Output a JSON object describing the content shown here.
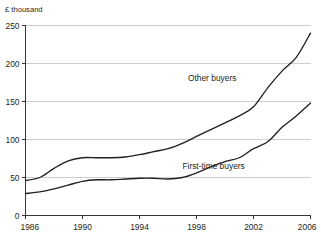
{
  "chart_data": {
    "type": "line",
    "title": "",
    "subtitle": "",
    "xlabel": "",
    "ylabel": "£ thousand",
    "ylim": [
      0,
      250
    ],
    "xlim": [
      1986,
      2006
    ],
    "yticks": [
      0,
      50,
      100,
      150,
      200,
      250
    ],
    "ytick_labels": [
      "0",
      "50",
      "100",
      "150",
      "200",
      "250"
    ],
    "xticks": [
      1986,
      1990,
      1994,
      1998,
      2002,
      2006
    ],
    "xtick_labels": [
      "1986",
      "1990",
      "1994",
      "1998",
      "2002",
      "2006"
    ],
    "grid": "horizontal",
    "legend_position": "inline-annotation",
    "x": [
      1986,
      1987,
      1988,
      1989,
      1990,
      1991,
      1992,
      1993,
      1994,
      1995,
      1996,
      1997,
      1998,
      1999,
      2000,
      2001,
      2002,
      2003,
      2004,
      2005,
      2006
    ],
    "series": [
      {
        "name": "Other buyers",
        "label": "Other buyers",
        "color": "#231f20",
        "values": [
          46,
          50,
          62,
          72,
          76,
          76,
          76,
          77,
          80,
          84,
          88,
          95,
          104,
          113,
          122,
          131,
          143,
          168,
          190,
          208,
          240
        ]
      },
      {
        "name": "First-time buyers",
        "label": "First-time buyers",
        "color": "#231f20",
        "values": [
          29,
          31,
          35,
          40,
          45,
          47,
          47,
          48,
          49,
          49,
          48,
          50,
          56,
          64,
          71,
          76,
          88,
          97,
          116,
          131,
          148
        ]
      }
    ],
    "annotations": [
      {
        "text": "Other buyers",
        "x": 1999.1,
        "y": 177
      },
      {
        "text": "First-time buyers",
        "x": 1999.2,
        "y": 61
      }
    ]
  }
}
